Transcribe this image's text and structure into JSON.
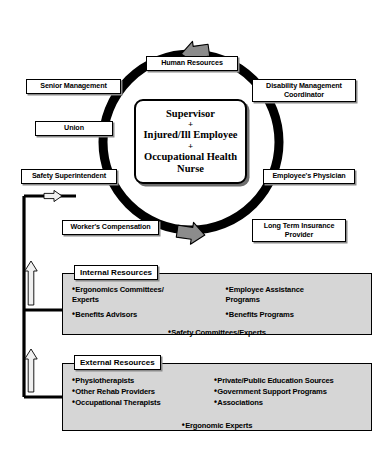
{
  "diagram": {
    "center": {
      "lines": [
        "Supervisor",
        "+",
        "Injured/Ill Employee",
        "+",
        "Occupational Health",
        "Nurse"
      ],
      "line1": "Supervisor",
      "plus1": "+",
      "line2": "Injured/Ill Employee",
      "plus2": "+",
      "line3": "Occupational Health",
      "line4": "Nurse"
    },
    "cycle_nodes": [
      {
        "id": "human-resources",
        "label": "Human Resources"
      },
      {
        "id": "disability-management-coordinator",
        "label": "Disability Management Coordinator"
      },
      {
        "id": "employees-physician",
        "label": "Employee's Physician"
      },
      {
        "id": "long-term-insurance-provider",
        "label": "Long Term Insurance Provider"
      },
      {
        "id": "workers-compensation",
        "label": "Worker's Compensation"
      },
      {
        "id": "safety-superintendent",
        "label": "Safety Superintendent"
      },
      {
        "id": "union",
        "label": "Union"
      },
      {
        "id": "senior-management",
        "label": "Senior Management"
      }
    ],
    "nodes": {
      "human_resources": "Human Resources",
      "disability_coordinator_line1": "Disability Management",
      "disability_coordinator_line2": "Coordinator",
      "employees_physician": "Employee's Physician",
      "long_term_insurance_line1": "Long Term Insurance",
      "long_term_insurance_line2": "Provider",
      "workers_compensation": "Worker's Compensation",
      "safety_superintendent": "Safety Superintendent",
      "union": "Union",
      "senior_management": "Senior Management"
    },
    "internal_resources": {
      "title": "Internal Resources",
      "left_column": [
        "Ergonomics Committees/ Experts",
        "Benefits Advisors"
      ],
      "right_column": [
        "Employee Assistance Programs",
        "Benefits Programs"
      ],
      "footer": "Safety Committees/Experts"
    },
    "external_resources": {
      "title": "External Resources",
      "left_column": [
        "Physiotherapists",
        "Other Rehab Providers",
        "Occupational Therapists"
      ],
      "right_column": [
        "Private/Public Education Sources",
        "Government Support Programs",
        "Associations"
      ],
      "footer": "Ergonomic Experts"
    },
    "colors": {
      "ring": "#000000",
      "panel_fill": "#d6d6d6",
      "arrow_fill": "#8c8c8c",
      "arrow_stroke": "#000000",
      "node_fill": "#ffffff",
      "shadow": "#8a8a8a",
      "text": "#000000"
    },
    "icons": {
      "cycle_arrow_top": "arrow-left-icon",
      "cycle_arrow_bottom": "arrow-right-icon",
      "feed_arrow_right": "arrow-right-outline-icon",
      "feed_arrow_up_internal": "arrow-up-outline-icon",
      "feed_arrow_up_external": "arrow-up-outline-icon"
    }
  }
}
